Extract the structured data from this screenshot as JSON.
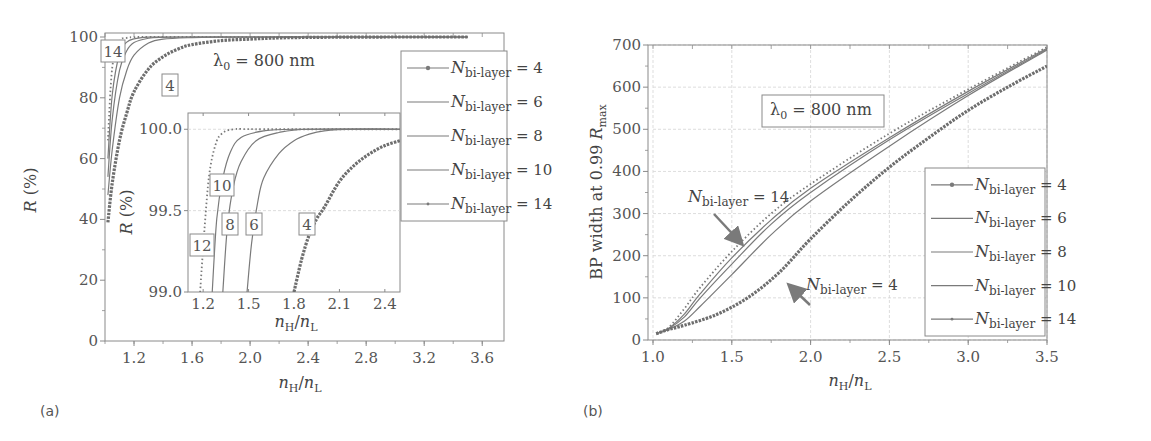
{
  "panels": {
    "a": {
      "label": "(a)"
    },
    "b": {
      "label": "(b)"
    }
  },
  "chart_data": [
    {
      "id": "a",
      "type": "line",
      "title": "",
      "annotation": "λ0 = 800 nm",
      "xlabel": "nH/nL",
      "ylabel": "R (%)",
      "xlim": [
        1.0,
        3.75
      ],
      "ylim": [
        0,
        100
      ],
      "xticks": [
        1.2,
        1.6,
        2.0,
        2.4,
        2.8,
        3.2,
        3.6
      ],
      "yticks": [
        0,
        20,
        40,
        60,
        80,
        100
      ],
      "legend_position": "upper right",
      "curve_labels": [
        "14",
        "4"
      ],
      "series": [
        {
          "name": "N_bi-layer = 4",
          "marker": "dot",
          "x": [
            1.02,
            1.05,
            1.1,
            1.15,
            1.2,
            1.3,
            1.4,
            1.5,
            1.6,
            1.8,
            2.0,
            2.2,
            2.5,
            3.0,
            3.5
          ],
          "values": [
            39,
            52,
            66,
            75,
            82,
            89.5,
            93.5,
            96,
            97.5,
            98.8,
            99.3,
            99.7,
            99.9,
            100,
            100
          ]
        },
        {
          "name": "N_bi-layer = 6",
          "marker": "none",
          "x": [
            1.02,
            1.05,
            1.1,
            1.15,
            1.2,
            1.3,
            1.4,
            1.6,
            1.8,
            2.0,
            2.5,
            3.5
          ],
          "values": [
            48,
            63,
            80,
            89,
            94,
            98,
            99.3,
            99.8,
            99.95,
            100,
            100,
            100
          ]
        },
        {
          "name": "N_bi-layer = 8",
          "marker": "none",
          "x": [
            1.02,
            1.05,
            1.1,
            1.15,
            1.2,
            1.3,
            1.4,
            1.6,
            2.0,
            3.5
          ],
          "values": [
            54,
            73,
            89,
            95.5,
            98.2,
            99.6,
            99.9,
            100,
            100,
            100
          ]
        },
        {
          "name": "N_bi-layer = 10",
          "marker": "none",
          "x": [
            1.02,
            1.05,
            1.1,
            1.15,
            1.2,
            1.3,
            1.4,
            2.0,
            3.5
          ],
          "values": [
            60,
            81,
            94.5,
            98.3,
            99.4,
            99.95,
            100,
            100,
            100
          ]
        },
        {
          "name": "N_bi-layer = 14",
          "marker": "small-dot",
          "x": [
            1.02,
            1.05,
            1.1,
            1.15,
            1.2,
            1.3,
            2.0,
            3.5
          ],
          "values": [
            66,
            90,
            98.5,
            99.7,
            99.95,
            100,
            100,
            100
          ]
        }
      ],
      "inset": {
        "xlabel": "nH/nL",
        "ylabel": "R (%)",
        "xlim": [
          1.1,
          2.5
        ],
        "ylim": [
          99.0,
          100.1
        ],
        "xticks": [
          1.2,
          1.5,
          1.8,
          2.1,
          2.4
        ],
        "yticks": [
          99.0,
          99.5,
          100.0
        ],
        "curve_labels": [
          "12",
          "10",
          "8",
          "6",
          "4"
        ],
        "series": [
          {
            "name": "N_bi-layer = 4",
            "x": [
              1.8,
              1.85,
              1.9,
              1.95,
              2.0,
              2.1,
              2.2,
              2.3,
              2.4,
              2.5
            ],
            "values": [
              99.0,
              99.2,
              99.35,
              99.45,
              99.52,
              99.68,
              99.78,
              99.85,
              99.9,
              99.93
            ]
          },
          {
            "name": "N_bi-layer = 6",
            "x": [
              1.49,
              1.52,
              1.56,
              1.6,
              1.7,
              1.8,
              1.9,
              2.0,
              2.2,
              2.5
            ],
            "values": [
              99.0,
              99.3,
              99.55,
              99.7,
              99.85,
              99.93,
              99.97,
              99.99,
              100,
              100
            ]
          },
          {
            "name": "N_bi-layer = 8",
            "x": [
              1.33,
              1.36,
              1.4,
              1.45,
              1.55,
              1.7,
              1.9,
              2.5
            ],
            "values": [
              99.0,
              99.4,
              99.65,
              99.8,
              99.93,
              99.98,
              100,
              100
            ]
          },
          {
            "name": "N_bi-layer = 10",
            "x": [
              1.26,
              1.29,
              1.33,
              1.38,
              1.45,
              1.6,
              1.8,
              2.5
            ],
            "values": [
              99.0,
              99.45,
              99.7,
              99.86,
              99.95,
              99.99,
              100,
              100
            ]
          },
          {
            "name": "N_bi-layer = 12",
            "x": [
              1.18,
              1.21,
              1.24,
              1.28,
              1.32,
              1.4,
              1.6,
              2.5
            ],
            "values": [
              99.0,
              99.4,
              99.72,
              99.9,
              99.97,
              100,
              100,
              100
            ]
          }
        ]
      }
    },
    {
      "id": "b",
      "type": "line",
      "title": "",
      "annotation": "λ0 = 800 nm",
      "xlabel": "nH/nL",
      "ylabel": "BP width at 0.99 Rmax",
      "xlim": [
        1.0,
        3.5
      ],
      "ylim": [
        0,
        700
      ],
      "xticks": [
        1.0,
        1.5,
        2.0,
        2.5,
        3.0,
        3.5
      ],
      "yticks": [
        0,
        100,
        200,
        300,
        400,
        500,
        600,
        700
      ],
      "grid": true,
      "legend_position": "center right",
      "arrow_labels": [
        "N_bi-layer = 14",
        "N_bi-layer = 4"
      ],
      "series": [
        {
          "name": "N_bi-layer = 4",
          "marker": "dot",
          "x": [
            1.02,
            1.1,
            1.2,
            1.4,
            1.6,
            1.8,
            2.0,
            2.25,
            2.5,
            2.75,
            3.0,
            3.25,
            3.5
          ],
          "values": [
            15,
            25,
            35,
            60,
            100,
            160,
            240,
            330,
            410,
            480,
            545,
            600,
            650
          ]
        },
        {
          "name": "N_bi-layer = 6",
          "marker": "none",
          "x": [
            1.02,
            1.1,
            1.2,
            1.3,
            1.5,
            1.75,
            2.0,
            2.5,
            3.0,
            3.5
          ],
          "values": [
            15,
            25,
            45,
            80,
            155,
            250,
            330,
            460,
            580,
            688
          ]
        },
        {
          "name": "N_bi-layer = 8",
          "marker": "none",
          "x": [
            1.02,
            1.1,
            1.2,
            1.3,
            1.5,
            1.75,
            2.0,
            2.5,
            3.0,
            3.5
          ],
          "values": [
            15,
            27,
            55,
            100,
            180,
            275,
            350,
            475,
            585,
            690
          ]
        },
        {
          "name": "N_bi-layer = 10",
          "marker": "none",
          "x": [
            1.02,
            1.1,
            1.2,
            1.3,
            1.5,
            1.75,
            2.0,
            2.5,
            3.0,
            3.5
          ],
          "values": [
            15,
            28,
            62,
            110,
            195,
            285,
            360,
            480,
            590,
            692
          ]
        },
        {
          "name": "N_bi-layer = 14",
          "marker": "small-dot",
          "x": [
            1.02,
            1.1,
            1.2,
            1.3,
            1.5,
            1.75,
            2.0,
            2.5,
            3.0,
            3.5
          ],
          "values": [
            15,
            30,
            75,
            125,
            210,
            300,
            370,
            490,
            595,
            695
          ]
        }
      ]
    }
  ],
  "legend": {
    "items": [
      {
        "sym": "N",
        "sub": "bi-layer",
        "val": " = 4"
      },
      {
        "sym": "N",
        "sub": "bi-layer",
        "val": " = 6"
      },
      {
        "sym": "N",
        "sub": "bi-layer",
        "val": " = 8"
      },
      {
        "sym": "N",
        "sub": "bi-layer",
        "val": " = 10"
      },
      {
        "sym": "N",
        "sub": "bi-layer",
        "val": " = 14"
      }
    ]
  },
  "colors": {
    "axis": "#8a8a8a",
    "curve": "#7a7a7a",
    "thick_curve": "#6e6e6e",
    "grid": "#d4d4d4",
    "text": "#444444"
  }
}
